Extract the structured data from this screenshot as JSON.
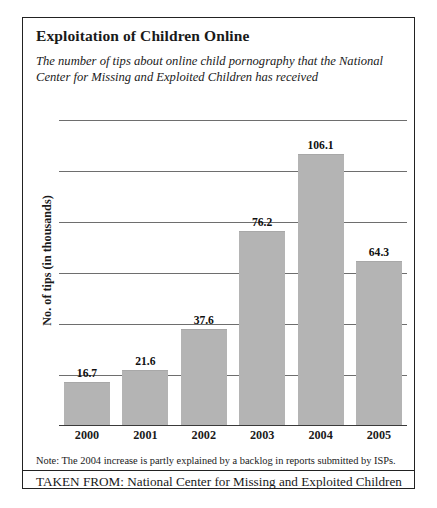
{
  "figure": {
    "title": "Exploitation of Children Online",
    "subtitle": "The number of tips about online child pornography that the National Center for Missing and Exploited Children has received",
    "note": "Note: The 2004 increase is partly explained by a backlog in reports submitted by ISPs.",
    "source": "TAKEN FROM: National Center for Missing and Exploited Children",
    "bar_color": "#b4b4b4",
    "border_color": "#222222",
    "gridline_color": "#6e6e6e"
  },
  "chart_data": {
    "type": "bar",
    "title": "Exploitation of Children Online",
    "subtitle": "The number of tips about online child pornography that the National Center for Missing and Exploited Children has received",
    "categories": [
      "2000",
      "2001",
      "2002",
      "2003",
      "2004",
      "2005"
    ],
    "values": [
      16.7,
      21.6,
      37.6,
      76.2,
      106.1,
      64.3
    ],
    "value_labels": [
      "16.7",
      "21.6",
      "37.6",
      "76.2",
      "106.1",
      "64.3"
    ],
    "xlabel": "",
    "ylabel": "No. of tips (in thousands)",
    "ylim": [
      0,
      120
    ],
    "yticks": [
      0,
      20,
      40,
      60,
      80,
      100,
      120
    ],
    "ytick_labels_shown": false,
    "grid": true,
    "legend": "none",
    "annotations": [
      "Note: The 2004 increase is partly explained by a backlog in reports submitted by ISPs."
    ]
  }
}
